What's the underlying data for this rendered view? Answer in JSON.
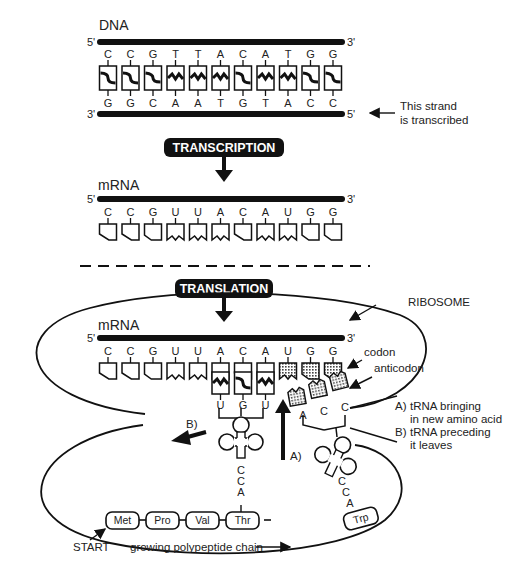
{
  "dna": {
    "label": "DNA",
    "top_strand": {
      "left_end": "5'",
      "right_end": "3'",
      "bases": [
        "C",
        "C",
        "G",
        "T",
        "T",
        "A",
        "C",
        "A",
        "T",
        "G",
        "G"
      ]
    },
    "bottom_strand": {
      "left_end": "3'",
      "right_end": "5'",
      "bases": [
        "G",
        "G",
        "C",
        "A",
        "A",
        "T",
        "G",
        "T",
        "A",
        "C",
        "C"
      ]
    },
    "transcribed_note": [
      "This strand",
      "is transcribed"
    ]
  },
  "transcription": {
    "label": "TRANSCRIPTION"
  },
  "mrna": {
    "label": "mRNA",
    "left_end": "5'",
    "right_end": "3'",
    "bases": [
      "C",
      "C",
      "G",
      "U",
      "U",
      "A",
      "C",
      "A",
      "U",
      "G",
      "G"
    ]
  },
  "translation": {
    "label": "TRANSLATION",
    "ribosome_label": "RIBOSOME",
    "mrna_label": "mRNA",
    "left_end": "5'",
    "right_end": "3'",
    "bases": [
      "C",
      "C",
      "G",
      "U",
      "U",
      "A",
      "C",
      "A",
      "U",
      "G",
      "G"
    ],
    "codon_label": "codon",
    "anticodon_label": "anticodon",
    "trna_current": {
      "anticodon": [
        "U",
        "G",
        "U"
      ],
      "tail": [
        "C",
        "C",
        "A"
      ]
    },
    "trna_incoming": {
      "anticodon": [
        "A",
        "C",
        "C"
      ],
      "tail": [
        "C",
        "C",
        "A"
      ],
      "amino_acid": "Trp"
    },
    "arrow_a_label": "A)",
    "arrow_b_label": "B)",
    "legend": [
      {
        "key": "A)",
        "lines": [
          "tRNA bringing",
          "in new amino acid"
        ]
      },
      {
        "key": "B)",
        "lines": [
          "tRNA preceding",
          "it leaves"
        ]
      }
    ],
    "polypeptide": [
      "Met",
      "Pro",
      "Val",
      "Thr"
    ],
    "start_label": "START",
    "chain_label": "growing polypeptide chain"
  },
  "colors": {
    "ink": "#111111",
    "text": "#222222",
    "background": "#ffffff",
    "stipple": "#888888"
  }
}
